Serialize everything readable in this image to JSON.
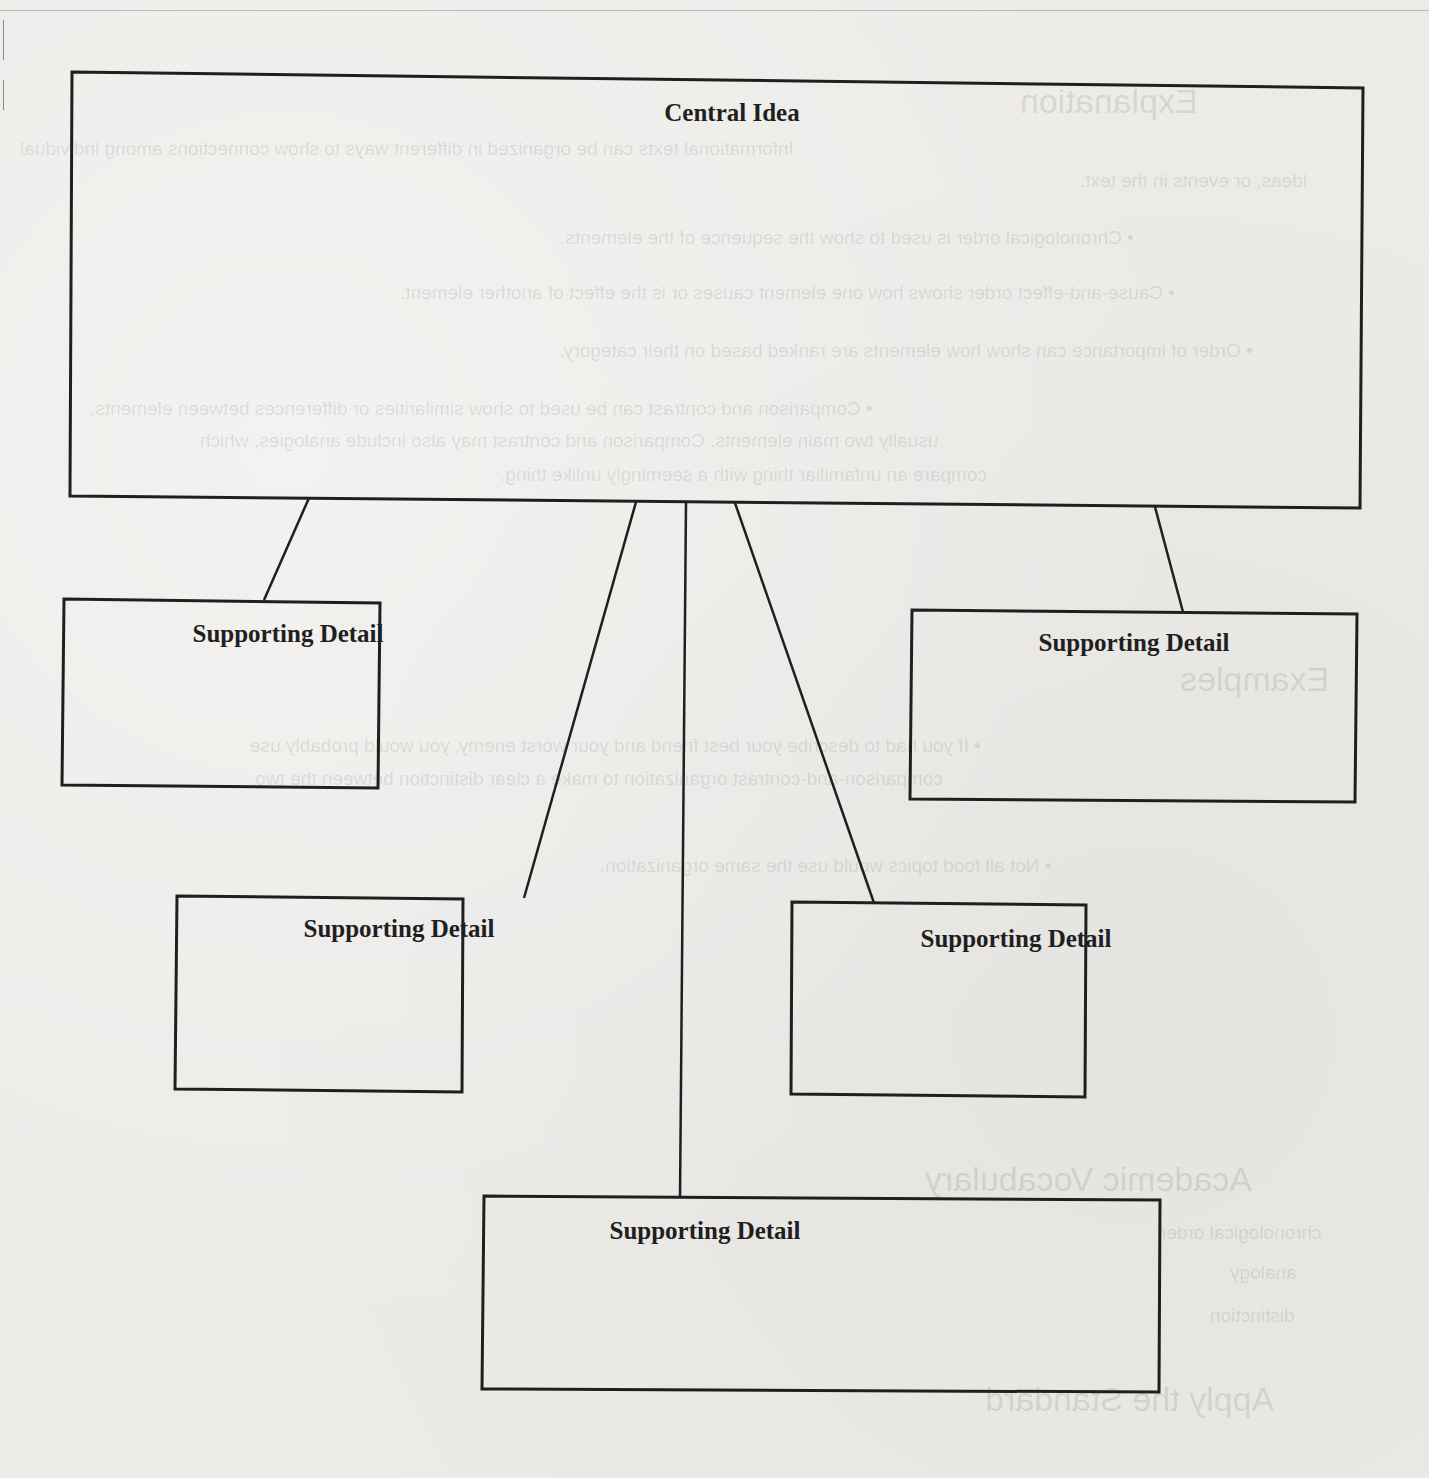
{
  "diagram": {
    "type": "main-idea-and-details organizer",
    "central": {
      "label": "Central Idea"
    },
    "details": [
      {
        "id": "sd1",
        "label": "Supporting Detail"
      },
      {
        "id": "sd2",
        "label": "Supporting Detail"
      },
      {
        "id": "sd3",
        "label": "Supporting Detail"
      },
      {
        "id": "sd4",
        "label": "Supporting Detail"
      },
      {
        "id": "sd5",
        "label": "Supporting Detail"
      }
    ]
  },
  "show_through": {
    "headings": [
      "Explanation",
      "Examples",
      "Academic Vocabulary",
      "Apply the Standard"
    ],
    "lines": [
      "Informational texts can be organized in different ways to show connections among individual",
      "ideas, or events in the text.",
      "• Chronological order is used to show the sequence of the elements.",
      "• Cause-and-effect order shows how one element causes or is the effect of another element.",
      "• Order of importance can show how elements are ranked based on their category.",
      "• Comparison and contrast can be used to show similarities or differences between elements,",
      "usually two main elements. Comparison and contrast may also include analogies, which",
      "compare an unfamiliar thing with a seemingly unlike thing.",
      "• If you had to describe your best friend and your worst enemy, you would probably use",
      "comparison-and-contrast organization to make a clear distinction between the two.",
      "• Not all food topics would use the same organization.",
      "chronological order",
      "analogy",
      "distinction"
    ]
  },
  "colors": {
    "paper": "#ecebe8",
    "ink": "#1f1f1f"
  }
}
